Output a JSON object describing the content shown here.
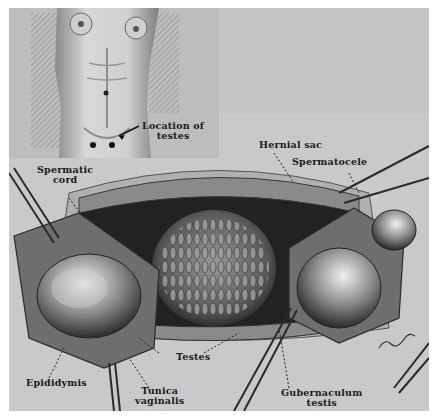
{
  "figure": {
    "labels": {
      "location_of_testes": [
        "Location of",
        "testes"
      ],
      "spermatic_cord": [
        "Spermatic",
        "cord"
      ],
      "hernial_sac": "Hernial sac",
      "spermatocele": "Spermatocele",
      "testes": "Testes",
      "epididymis": "Epididymis",
      "tunica_vaginalis": [
        "Tunica",
        "vaginalis"
      ],
      "gubernaculum_testis": [
        "Gubernaculum",
        "testis"
      ]
    },
    "signature": "artist-signature",
    "colors": {
      "background": "#ffffff",
      "plate": "#c9c9c9",
      "dark_tissue": "#2a2a2a",
      "mid_tissue": "#7a7a7a",
      "highlight": "#e6e6e6"
    }
  }
}
